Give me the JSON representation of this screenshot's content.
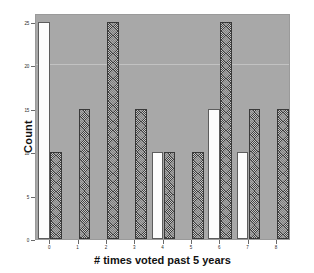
{
  "chart_data": {
    "type": "bar",
    "title": "",
    "xlabel": "# times voted past 5 years",
    "ylabel": "Count",
    "categories": [
      "0",
      "1",
      "2",
      "3",
      "4",
      "5",
      "6",
      "7",
      "8"
    ],
    "series": [
      {
        "name": "light",
        "style": "white-filled",
        "values": [
          25,
          0,
          0,
          0,
          10,
          0,
          15,
          10,
          0
        ]
      },
      {
        "name": "dark",
        "style": "dark-hatched",
        "values": [
          10,
          15,
          25,
          15,
          10,
          10,
          25,
          15,
          15
        ]
      }
    ],
    "ylim": [
      0,
      26
    ],
    "yticks": [
      0,
      5,
      10,
      15,
      20,
      25
    ],
    "ytick_labels": [
      "0",
      "5",
      "10",
      "15",
      "20",
      "25"
    ],
    "gridlines": [
      20
    ],
    "grid": true,
    "legend": "none",
    "plot_background": "#a8a8a8",
    "figure_background": "#ffffff",
    "light_bar_color": "#fdfdfd",
    "dark_bar_color": "#3f3f3f"
  }
}
